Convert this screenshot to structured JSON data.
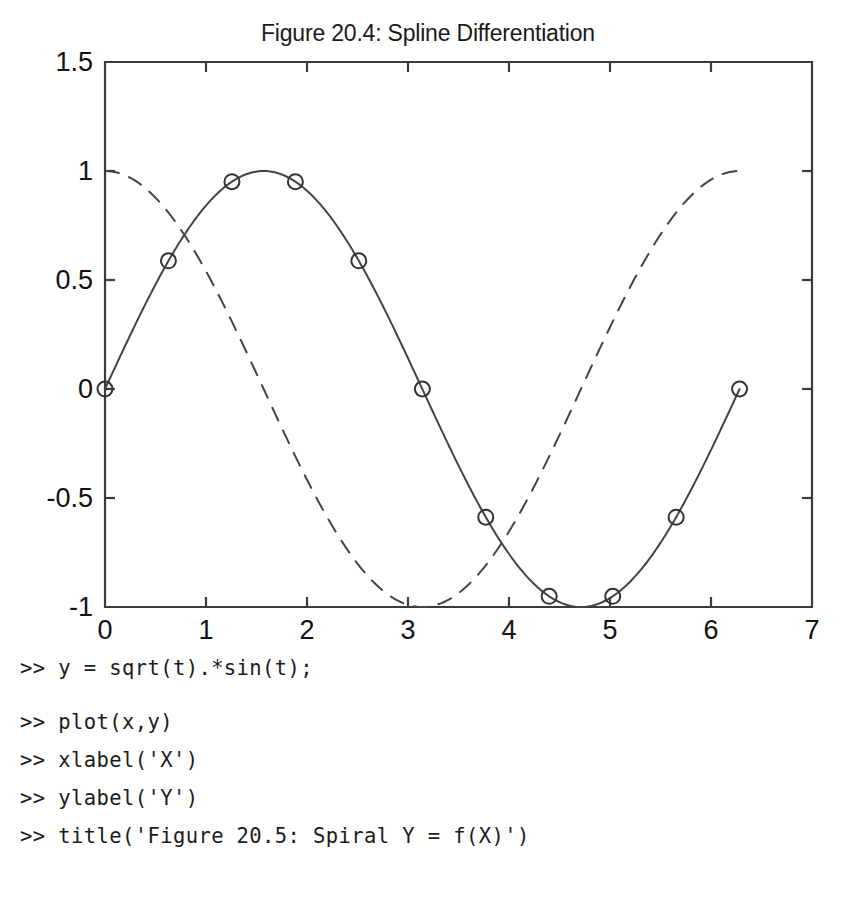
{
  "figure": {
    "title": "Figure 20.4: Spline Differentiation",
    "axis_color": "#3b3b3b",
    "curve_color": "#444444",
    "marker_color": "#333333"
  },
  "chart_data": {
    "type": "line",
    "title": "Figure 20.4: Spline Differentiation",
    "xlabel": "",
    "ylabel": "",
    "xlim": [
      0,
      7
    ],
    "ylim": [
      -1,
      1.5
    ],
    "xticks": [
      "0",
      "1",
      "2",
      "3",
      "4",
      "5",
      "6",
      "7"
    ],
    "xtick_values": [
      0,
      1,
      2,
      3,
      4,
      5,
      6,
      7
    ],
    "yticks": [
      "1.5",
      "1",
      "0.5",
      "0",
      "-0.5",
      "-1"
    ],
    "ytick_values": [
      1.5,
      1,
      0.5,
      0,
      -0.5,
      -1
    ],
    "grid": false,
    "legend": "none",
    "series": [
      {
        "name": "spline sin(x)",
        "style": "solid",
        "marker": "circle",
        "marker_x": [
          0,
          0.628,
          1.257,
          1.885,
          2.513,
          3.142,
          3.77,
          4.398,
          5.027,
          5.655,
          6.283
        ],
        "marker_y": [
          0,
          0.588,
          0.951,
          0.951,
          0.588,
          0,
          -0.588,
          -0.951,
          -0.951,
          -0.588,
          0
        ],
        "function": "sin(x)",
        "x_start": 0,
        "x_end": 6.283
      },
      {
        "name": "derivative cos(x)",
        "style": "dashed",
        "marker": "none",
        "function": "cos(x)",
        "x_start": 0,
        "x_end": 6.283
      }
    ]
  },
  "console": {
    "lines": [
      ">> y = sqrt(t).*sin(t);",
      "",
      ">> plot(x,y)",
      ">> xlabel('X')",
      ">> ylabel('Y')",
      ">> title('Figure 20.5: Spiral Y = f(X)')"
    ]
  }
}
